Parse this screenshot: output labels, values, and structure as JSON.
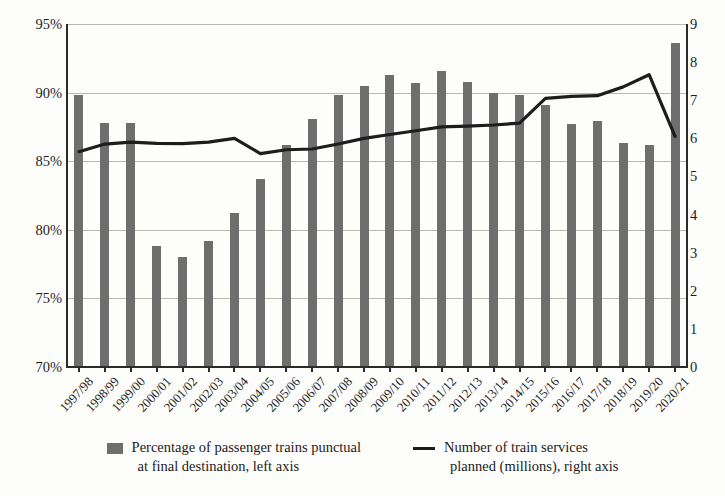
{
  "chart_data": {
    "type": "bar",
    "title": "",
    "xlabel": "",
    "ylabel": "",
    "categories": [
      "1997/98",
      "1998/99",
      "1999/00",
      "2000/01",
      "2001/02",
      "2002/03",
      "2003/04",
      "2004/05",
      "2005/06",
      "2006/07",
      "2007/08",
      "2008/09",
      "2009/10",
      "2010/11",
      "2011/12",
      "2012/13",
      "2013/14",
      "2014/15",
      "2015/16",
      "2016/17",
      "2017/18",
      "2018/19",
      "2019/20",
      "2020/21"
    ],
    "series": [
      {
        "name": "Percentage of passenger trains punctual at final destination, left axis",
        "type": "bar",
        "axis": "left",
        "unit": "%",
        "color": "#6e6e6e",
        "values": [
          89.8,
          87.8,
          87.8,
          78.8,
          78.0,
          79.2,
          81.2,
          83.7,
          86.2,
          88.1,
          89.8,
          90.5,
          91.3,
          90.7,
          91.6,
          90.8,
          90.0,
          89.8,
          89.1,
          87.7,
          87.9,
          86.3,
          86.2,
          93.6
        ]
      },
      {
        "name": "Number of train services planned (millions), right axis",
        "type": "line",
        "axis": "right",
        "unit": "millions",
        "color": "#1d1d1d",
        "values": [
          5.65,
          5.85,
          5.9,
          5.87,
          5.86,
          5.9,
          6.0,
          5.6,
          5.7,
          5.72,
          5.85,
          6.0,
          6.1,
          6.2,
          6.3,
          6.32,
          6.35,
          6.4,
          7.05,
          7.1,
          7.12,
          7.35,
          7.67,
          6.05
        ]
      }
    ],
    "axes": {
      "left": {
        "ticks": [
          "70%",
          "75%",
          "80%",
          "85%",
          "90%",
          "95%"
        ],
        "min": 70,
        "max": 95,
        "step": 5
      },
      "right": {
        "ticks": [
          "0",
          "1",
          "2",
          "3",
          "4",
          "5",
          "6",
          "7",
          "8",
          "9"
        ],
        "min": 0,
        "max": 9,
        "step": 1
      }
    },
    "grid": true,
    "legend_position": "bottom"
  },
  "legend": {
    "bar_entry": {
      "line1": "Percentage of passenger trains punctual",
      "line2": "at final destination, left axis"
    },
    "line_entry": {
      "line1": "Number of train services",
      "line2": "planned (millions), right axis"
    }
  }
}
